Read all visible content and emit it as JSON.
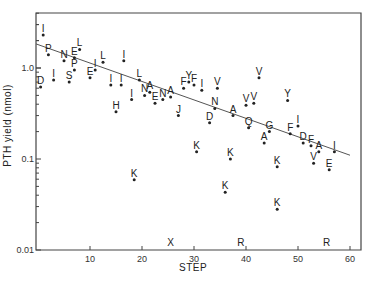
{
  "chart_data": {
    "type": "scatter",
    "title": "",
    "xlabel": "STEP",
    "ylabel": "PTH  yield (nmol)",
    "xscale": "linear",
    "yscale": "log",
    "xlim": [
      0,
      62
    ],
    "ylim": [
      0.01,
      4
    ],
    "x_ticks": [
      10,
      20,
      30,
      40,
      50,
      60
    ],
    "y_ticks": [
      {
        "value": 1.0,
        "label": "1.0"
      },
      {
        "value": 0.1,
        "label": "0.1"
      },
      {
        "value": 0.01,
        "label": "0.01"
      }
    ],
    "grid": false,
    "legend": null,
    "points": [
      {
        "label": "I",
        "x": 1,
        "y": 2.3
      },
      {
        "label": "D",
        "x": 0.5,
        "y": 0.62
      },
      {
        "label": "P",
        "x": 2,
        "y": 1.4
      },
      {
        "label": "I",
        "x": 3,
        "y": 0.74
      },
      {
        "label": "N",
        "x": 5,
        "y": 1.2
      },
      {
        "label": "S",
        "x": 6,
        "y": 0.7
      },
      {
        "label": "E",
        "x": 7,
        "y": 1.3
      },
      {
        "label": "P",
        "x": 7,
        "y": 0.95
      },
      {
        "label": "L",
        "x": 8,
        "y": 1.6
      },
      {
        "label": "E",
        "x": 10,
        "y": 0.78
      },
      {
        "label": "I",
        "x": 11,
        "y": 0.95
      },
      {
        "label": "L",
        "x": 12.5,
        "y": 1.16
      },
      {
        "label": "I",
        "x": 14,
        "y": 0.65
      },
      {
        "label": "H",
        "x": 15,
        "y": 0.33
      },
      {
        "label": "I",
        "x": 16,
        "y": 0.65
      },
      {
        "label": "I",
        "x": 16.5,
        "y": 1.2
      },
      {
        "label": "I",
        "x": 18,
        "y": 0.45
      },
      {
        "label": "K",
        "x": 18.5,
        "y": 0.059
      },
      {
        "label": "L",
        "x": 19.5,
        "y": 0.74
      },
      {
        "label": "N",
        "x": 20.5,
        "y": 0.5
      },
      {
        "label": "A",
        "x": 21.5,
        "y": 0.54
      },
      {
        "label": "E",
        "x": 22.5,
        "y": 0.41
      },
      {
        "label": "N",
        "x": 24,
        "y": 0.45
      },
      {
        "label": "A",
        "x": 25.5,
        "y": 0.48
      },
      {
        "label": "J",
        "x": 27,
        "y": 0.3
      },
      {
        "label": "F",
        "x": 28,
        "y": 0.6
      },
      {
        "label": "Y",
        "x": 29,
        "y": 0.7
      },
      {
        "label": "F",
        "x": 30,
        "y": 0.65
      },
      {
        "label": "K",
        "x": 30.5,
        "y": 0.12
      },
      {
        "label": "I",
        "x": 31.5,
        "y": 0.57
      },
      {
        "label": "D",
        "x": 33,
        "y": 0.25
      },
      {
        "label": "N",
        "x": 34,
        "y": 0.36
      },
      {
        "label": "V",
        "x": 34.5,
        "y": 0.6
      },
      {
        "label": "K",
        "x": 36,
        "y": 0.043
      },
      {
        "label": "K",
        "x": 37,
        "y": 0.1
      },
      {
        "label": "A",
        "x": 37.5,
        "y": 0.3
      },
      {
        "label": "V",
        "x": 40,
        "y": 0.39
      },
      {
        "label": "Q",
        "x": 40.5,
        "y": 0.22
      },
      {
        "label": "V",
        "x": 41.5,
        "y": 0.41
      },
      {
        "label": "V",
        "x": 42.5,
        "y": 0.78
      },
      {
        "label": "A",
        "x": 43.5,
        "y": 0.15
      },
      {
        "label": "G",
        "x": 44.5,
        "y": 0.2
      },
      {
        "label": "K",
        "x": 46,
        "y": 0.082
      },
      {
        "label": "K",
        "x": 46,
        "y": 0.028
      },
      {
        "label": "Y",
        "x": 48,
        "y": 0.44
      },
      {
        "label": "F",
        "x": 48.5,
        "y": 0.19
      },
      {
        "label": "I",
        "x": 50,
        "y": 0.23
      },
      {
        "label": "D",
        "x": 51,
        "y": 0.15
      },
      {
        "label": "F",
        "x": 52.5,
        "y": 0.14
      },
      {
        "label": "V",
        "x": 53,
        "y": 0.09
      },
      {
        "label": "A",
        "x": 54,
        "y": 0.12
      },
      {
        "label": "E",
        "x": 56,
        "y": 0.076
      },
      {
        "label": "I",
        "x": 57,
        "y": 0.12
      }
    ],
    "below_axis_labels": [
      {
        "label": "X",
        "x": 25.5
      },
      {
        "label": "R",
        "x": 39
      },
      {
        "label": "R",
        "x": 55.5
      }
    ],
    "fit_line": {
      "x": [
        0,
        60
      ],
      "y": [
        1.84,
        0.11
      ]
    }
  }
}
